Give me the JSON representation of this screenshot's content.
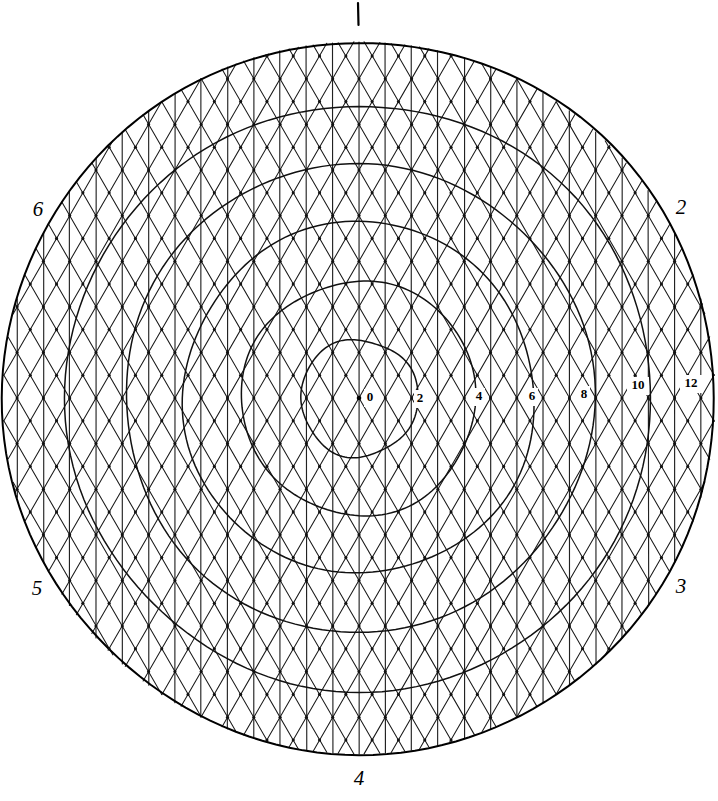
{
  "figure": {
    "kind": "hand-drawn-polar-hex-grid",
    "background_color": "#ffffff",
    "ink_color": "#000000",
    "width": 718,
    "height": 801
  },
  "chart_data": {
    "type": "scatter",
    "title": "",
    "subtitle": "",
    "xlabel": "",
    "ylabel": "",
    "projection": "polar",
    "grid": true,
    "legend": false,
    "center": {
      "x": 359,
      "y": 398
    },
    "outer_radius": 356,
    "unit_pixels_per_tick": 29.3,
    "radial_axis": {
      "label": "",
      "ticks": [
        0,
        2,
        4,
        6,
        8,
        10,
        12
      ],
      "tick_labels": [
        "0",
        "2",
        "4",
        "6",
        "8",
        "10",
        "12"
      ],
      "range": [
        0,
        12
      ],
      "tick_pixel_radii": [
        0,
        58.6,
        117.2,
        175.8,
        234.4,
        293.0,
        351.6
      ],
      "tick_label_positions": [
        {
          "label": "0",
          "x": 370,
          "y": 398
        },
        {
          "label": "2",
          "x": 420,
          "y": 399
        },
        {
          "label": "4",
          "x": 479,
          "y": 397
        },
        {
          "label": "6",
          "x": 532,
          "y": 397
        },
        {
          "label": "8",
          "x": 584,
          "y": 395
        },
        {
          "label": "10",
          "x": 638,
          "y": 386
        },
        {
          "label": "12",
          "x": 691,
          "y": 384
        }
      ]
    },
    "rings": [
      {
        "value": 2,
        "radius": 58.6
      },
      {
        "value": 4,
        "radius": 117.2
      },
      {
        "value": 6,
        "radius": 175.8
      },
      {
        "value": 8,
        "radius": 234.4
      },
      {
        "value": 10,
        "radius": 293.0
      },
      {
        "value": 12,
        "radius": 351.6
      }
    ],
    "sector_labels": [
      {
        "text": "1",
        "x": 358,
        "y": 14,
        "angle_deg": 90
      },
      {
        "text": "2",
        "x": 681,
        "y": 209,
        "angle_deg": 30
      },
      {
        "text": "3",
        "x": 681,
        "y": 588,
        "angle_deg": -30
      },
      {
        "text": "4",
        "x": 359,
        "y": 780,
        "angle_deg": -90
      },
      {
        "text": "5",
        "x": 37,
        "y": 590,
        "angle_deg": -150
      },
      {
        "text": "6",
        "x": 38,
        "y": 211,
        "angle_deg": 150
      }
    ],
    "mesh": {
      "description": "triangular/isometric lattice of vertical lines plus two diagonal families at +/-60 degrees, clipped to the outer circle",
      "column_spacing": 26.3,
      "row_spacing": 22.8,
      "vertical_family": true,
      "diagonal_families": 2,
      "diagonal_angle_deg": 60,
      "node_dots": true
    },
    "values": [],
    "categories": []
  }
}
